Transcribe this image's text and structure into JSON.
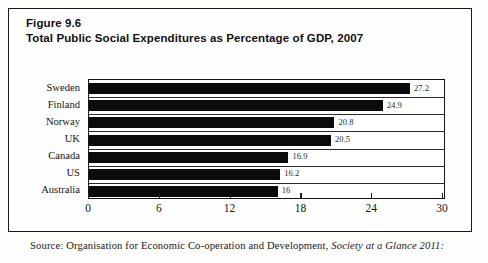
{
  "figure": {
    "number_label": "Figure 9.6",
    "title": "Total Public Social Expenditures as Percentage of GDP, 2007",
    "source_prefix": "Source: Organisation for Economic Co-operation and Development, ",
    "source_italic": "Society at a Glance 2011:"
  },
  "chart_data": {
    "type": "bar",
    "orientation": "horizontal",
    "title": "Total Public Social Expenditures as Percentage of GDP, 2007",
    "xlabel": "",
    "ylabel": "",
    "xlim": [
      0,
      30
    ],
    "xticks": [
      "0",
      "6",
      "12",
      "18",
      "24",
      "30"
    ],
    "grid": false,
    "legend": "none",
    "categories": [
      "Sweden",
      "Finland",
      "Norway",
      "UK",
      "Canada",
      "US",
      "Australia"
    ],
    "values": [
      27.2,
      24.9,
      20.8,
      20.5,
      16.9,
      16.2,
      16
    ],
    "value_labels": [
      "27.2",
      "24.9",
      "20.8",
      "20.5",
      "16.9",
      "16.2",
      "16"
    ],
    "bar_color": "#0b0b0b",
    "axis_color": "#161616"
  }
}
